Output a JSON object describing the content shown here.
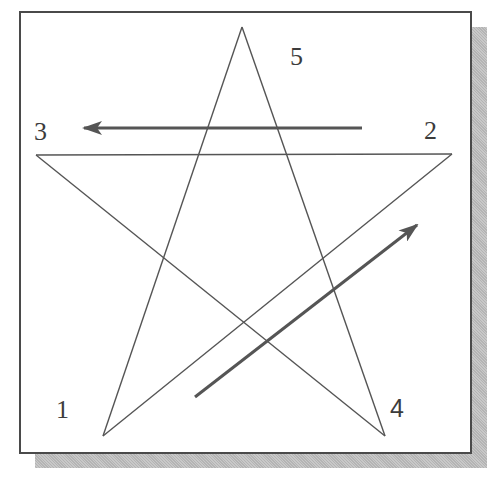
{
  "diagram": {
    "type": "five-point star drawing order",
    "vertices": [
      {
        "label": "1",
        "x": 103,
        "y": 436
      },
      {
        "label": "2",
        "x": 452,
        "y": 154
      },
      {
        "label": "3",
        "x": 36,
        "y": 155
      },
      {
        "label": "4",
        "x": 385,
        "y": 436
      },
      {
        "label": "5",
        "x": 242,
        "y": 27
      }
    ],
    "labels": {
      "v1": "1",
      "v2": "2",
      "v3": "3",
      "v4": "4",
      "v5": "5"
    },
    "arrows": [
      {
        "name": "arrow-1-to-2",
        "from": [
          195,
          397
        ],
        "to": [
          419,
          224
        ]
      },
      {
        "name": "arrow-2-to-3",
        "from": [
          362,
          128
        ],
        "to": [
          82,
          128
        ]
      }
    ],
    "colors": {
      "line": "#555555",
      "arrow": "#555555",
      "frame": "#4a4a4a",
      "shadow": "#bdbdbd"
    }
  }
}
